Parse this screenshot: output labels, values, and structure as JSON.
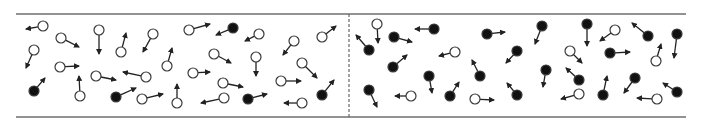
{
  "diagram": {
    "width": 706,
    "height": 125,
    "colors": {
      "wall": "#6e6e6e",
      "divider": "#666666",
      "particle_stroke": "#3a3a3a",
      "particle_filled": "#111111",
      "particle_open": "#ffffff",
      "arrow": "#222222",
      "background": "#ffffff"
    },
    "container": {
      "x1": 16,
      "x2": 686,
      "top_y": 14,
      "bottom_y": 117
    },
    "divider": {
      "x": 349,
      "style": "dashed"
    },
    "particle_radius": 5,
    "particles": [
      {
        "type": "open",
        "x": 43,
        "y": 26,
        "tx": 26,
        "ty": 29
      },
      {
        "type": "open",
        "x": 61,
        "y": 38,
        "tx": 79,
        "ty": 47
      },
      {
        "type": "open",
        "x": 34,
        "y": 50,
        "tx": 26,
        "ty": 68
      },
      {
        "type": "open",
        "x": 99,
        "y": 30,
        "tx": 99,
        "ty": 54
      },
      {
        "type": "open",
        "x": 121,
        "y": 52,
        "tx": 126,
        "ty": 33
      },
      {
        "type": "open",
        "x": 153,
        "y": 34,
        "tx": 143,
        "ty": 52
      },
      {
        "type": "open",
        "x": 60,
        "y": 67,
        "tx": 79,
        "ty": 66
      },
      {
        "type": "open",
        "x": 167,
        "y": 66,
        "tx": 172,
        "ty": 48
      },
      {
        "type": "filled",
        "x": 34,
        "y": 91,
        "tx": 45,
        "ty": 78
      },
      {
        "type": "open",
        "x": 80,
        "y": 96,
        "tx": 79,
        "ty": 76
      },
      {
        "type": "open",
        "x": 96,
        "y": 76,
        "tx": 116,
        "ty": 80
      },
      {
        "type": "open",
        "x": 146,
        "y": 77,
        "tx": 123,
        "ty": 72
      },
      {
        "type": "filled",
        "x": 116,
        "y": 97,
        "tx": 136,
        "ty": 88
      },
      {
        "type": "open",
        "x": 142,
        "y": 99,
        "tx": 163,
        "ty": 94
      },
      {
        "type": "open",
        "x": 177,
        "y": 103,
        "tx": 177,
        "ty": 84
      },
      {
        "type": "open",
        "x": 189,
        "y": 30,
        "tx": 210,
        "ty": 24
      },
      {
        "type": "filled",
        "x": 233,
        "y": 28,
        "tx": 216,
        "ty": 35
      },
      {
        "type": "open",
        "x": 259,
        "y": 34,
        "tx": 245,
        "ty": 41
      },
      {
        "type": "open",
        "x": 294,
        "y": 41,
        "tx": 283,
        "ty": 55
      },
      {
        "type": "open",
        "x": 322,
        "y": 37,
        "tx": 336,
        "ty": 26
      },
      {
        "type": "open",
        "x": 214,
        "y": 54,
        "tx": 231,
        "ty": 63
      },
      {
        "type": "open",
        "x": 256,
        "y": 57,
        "tx": 256,
        "ty": 76
      },
      {
        "type": "open",
        "x": 302,
        "y": 63,
        "tx": 317,
        "ty": 78
      },
      {
        "type": "open",
        "x": 193,
        "y": 73,
        "tx": 210,
        "ty": 72
      },
      {
        "type": "open",
        "x": 223,
        "y": 83,
        "tx": 243,
        "ty": 87
      },
      {
        "type": "open",
        "x": 281,
        "y": 81,
        "tx": 301,
        "ty": 81
      },
      {
        "type": "filled",
        "x": 322,
        "y": 95,
        "tx": 334,
        "ty": 80
      },
      {
        "type": "open",
        "x": 224,
        "y": 98,
        "tx": 201,
        "ty": 103
      },
      {
        "type": "filled",
        "x": 248,
        "y": 99,
        "tx": 267,
        "ty": 94
      },
      {
        "type": "open",
        "x": 302,
        "y": 103,
        "tx": 284,
        "ty": 103
      },
      {
        "type": "open",
        "x": 377,
        "y": 24,
        "tx": 378,
        "ty": 43
      },
      {
        "type": "filled",
        "x": 369,
        "y": 50,
        "tx": 356,
        "ty": 35
      },
      {
        "type": "filled",
        "x": 394,
        "y": 37,
        "tx": 412,
        "ty": 42
      },
      {
        "type": "filled",
        "x": 434,
        "y": 29,
        "tx": 415,
        "ty": 29
      },
      {
        "type": "filled",
        "x": 487,
        "y": 34,
        "tx": 505,
        "ty": 32
      },
      {
        "type": "open",
        "x": 455,
        "y": 52,
        "tx": 439,
        "ty": 56
      },
      {
        "type": "filled",
        "x": 393,
        "y": 67,
        "tx": 407,
        "ty": 55
      },
      {
        "type": "filled",
        "x": 429,
        "y": 76,
        "tx": 432,
        "ty": 93
      },
      {
        "type": "filled",
        "x": 480,
        "y": 76,
        "tx": 472,
        "ty": 60
      },
      {
        "type": "filled",
        "x": 369,
        "y": 90,
        "tx": 377,
        "ty": 107
      },
      {
        "type": "open",
        "x": 411,
        "y": 96,
        "tx": 395,
        "ty": 96
      },
      {
        "type": "filled",
        "x": 450,
        "y": 96,
        "tx": 459,
        "ty": 82
      },
      {
        "type": "open",
        "x": 475,
        "y": 99,
        "tx": 494,
        "ty": 100
      },
      {
        "type": "filled",
        "x": 517,
        "y": 51,
        "tx": 506,
        "ty": 63
      },
      {
        "type": "filled",
        "x": 517,
        "y": 95,
        "tx": 507,
        "ty": 83
      },
      {
        "type": "filled",
        "x": 542,
        "y": 26,
        "tx": 535,
        "ty": 44
      },
      {
        "type": "filled",
        "x": 587,
        "y": 24,
        "tx": 587,
        "ty": 46
      },
      {
        "type": "open",
        "x": 615,
        "y": 30,
        "tx": 600,
        "ty": 41
      },
      {
        "type": "filled",
        "x": 648,
        "y": 36,
        "tx": 632,
        "ty": 23
      },
      {
        "type": "filled",
        "x": 677,
        "y": 34,
        "tx": 674,
        "ty": 58
      },
      {
        "type": "open",
        "x": 570,
        "y": 51,
        "tx": 582,
        "ty": 63
      },
      {
        "type": "filled",
        "x": 610,
        "y": 53,
        "tx": 630,
        "ty": 52
      },
      {
        "type": "open",
        "x": 656,
        "y": 61,
        "tx": 661,
        "ty": 44
      },
      {
        "type": "filled",
        "x": 546,
        "y": 70,
        "tx": 543,
        "ty": 87
      },
      {
        "type": "filled",
        "x": 579,
        "y": 80,
        "tx": 566,
        "ty": 68
      },
      {
        "type": "filled",
        "x": 603,
        "y": 95,
        "tx": 607,
        "ty": 76
      },
      {
        "type": "filled",
        "x": 635,
        "y": 78,
        "tx": 624,
        "ty": 93
      },
      {
        "type": "open",
        "x": 579,
        "y": 94,
        "tx": 561,
        "ty": 99
      },
      {
        "type": "filled",
        "x": 677,
        "y": 92,
        "tx": 663,
        "ty": 83
      },
      {
        "type": "open",
        "x": 657,
        "y": 99,
        "tx": 637,
        "ty": 98
      }
    ]
  }
}
